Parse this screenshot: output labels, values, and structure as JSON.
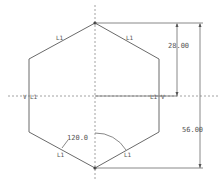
{
  "drawing": {
    "type": "sketch-hexagon",
    "colors": {
      "geometry": "#6a6a6a",
      "centerline": "#8a8a8a",
      "dimension": "#555555",
      "text": "#555555",
      "background": "#ffffff"
    },
    "dimensions": {
      "half_height": "28.00",
      "full_height": "56.00",
      "angle": "120.0"
    },
    "constraints": {
      "equal_length": "L1",
      "vertical": "V",
      "edge_labels": [
        "L1",
        "L1",
        "L1",
        "L1",
        "L1",
        "L1"
      ]
    }
  }
}
